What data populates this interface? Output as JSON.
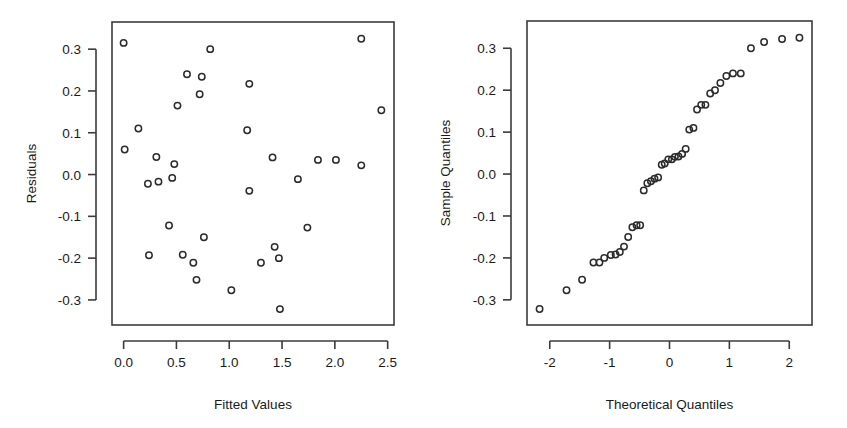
{
  "figure": {
    "background": "#ffffff",
    "point_color": "#2b2b2b",
    "axis_color": "#3b3b3b",
    "panel_count": 2
  },
  "chart_data": [
    {
      "type": "scatter",
      "id": "residuals-vs-fitted",
      "title": "",
      "xlabel": "Fitted Values",
      "ylabel": "Residuals",
      "xlim": [
        -0.11,
        2.56
      ],
      "ylim": [
        -0.36,
        0.365
      ],
      "xticks": [
        0.0,
        0.5,
        1.0,
        1.5,
        2.0,
        2.5
      ],
      "xticklabels": [
        "0.0",
        "0.5",
        "1.0",
        "1.5",
        "2.0",
        "2.5"
      ],
      "yticks": [
        0.3,
        0.2,
        0.1,
        0.0,
        -0.1,
        -0.2,
        -0.3
      ],
      "yticklabels": [
        "0.3",
        "0.2",
        "0.1",
        "0.0",
        "-0.1",
        "-0.2",
        "-0.3"
      ],
      "grid": false,
      "legend": false,
      "marker": "open-circle",
      "x": [
        0.0,
        0.01,
        0.14,
        0.23,
        0.24,
        0.31,
        0.33,
        0.43,
        0.46,
        0.48,
        0.51,
        0.56,
        0.6,
        0.66,
        0.69,
        0.72,
        0.74,
        0.76,
        0.82,
        1.02,
        1.17,
        1.19,
        1.19,
        1.3,
        1.41,
        1.43,
        1.47,
        1.48,
        1.65,
        1.74,
        1.84,
        2.01,
        2.25,
        2.25,
        2.44
      ],
      "y": [
        0.315,
        0.06,
        0.11,
        -0.022,
        -0.193,
        0.042,
        -0.017,
        -0.122,
        -0.008,
        0.025,
        0.165,
        -0.192,
        0.24,
        -0.211,
        -0.252,
        0.192,
        0.234,
        -0.15,
        0.3,
        -0.277,
        0.106,
        0.217,
        -0.039,
        -0.211,
        0.041,
        -0.173,
        -0.2,
        -0.322,
        -0.011,
        -0.127,
        0.035,
        0.035,
        0.022,
        0.325,
        0.154
      ]
    },
    {
      "type": "scatter",
      "id": "normal-qq",
      "title": "",
      "xlabel": "Theoretical Quantiles",
      "ylabel": "Sample Quantiles",
      "xlim": [
        -2.38,
        2.38
      ],
      "ylim": [
        -0.36,
        0.365
      ],
      "xticks": [
        -2,
        -1,
        0,
        1,
        2
      ],
      "xticklabels": [
        "-2",
        "-1",
        "0",
        "1",
        "2"
      ],
      "yticks": [
        0.3,
        0.2,
        0.1,
        0.0,
        -0.1,
        -0.2,
        -0.3
      ],
      "yticklabels": [
        "0.3",
        "0.2",
        "0.1",
        "0.0",
        "-0.1",
        "-0.2",
        "-0.3"
      ],
      "grid": false,
      "legend": false,
      "marker": "open-circle",
      "x": [
        -2.17,
        -1.72,
        -1.46,
        -1.27,
        -1.17,
        -1.09,
        -0.98,
        -0.9,
        -0.83,
        -0.76,
        -0.69,
        -0.62,
        -0.55,
        -0.49,
        -0.43,
        -0.37,
        -0.31,
        -0.25,
        -0.19,
        -0.13,
        -0.08,
        -0.02,
        0.04,
        0.09,
        0.15,
        0.21,
        0.27,
        0.33,
        0.4,
        0.46,
        0.53,
        0.6,
        0.68,
        0.76,
        0.85,
        0.95,
        1.06,
        1.19,
        1.36,
        1.58,
        1.88,
        2.17
      ],
      "y": [
        -0.322,
        -0.277,
        -0.252,
        -0.211,
        -0.211,
        -0.2,
        -0.193,
        -0.192,
        -0.186,
        -0.173,
        -0.15,
        -0.127,
        -0.122,
        -0.122,
        -0.039,
        -0.022,
        -0.017,
        -0.011,
        -0.008,
        0.022,
        0.025,
        0.035,
        0.035,
        0.041,
        0.042,
        0.048,
        0.06,
        0.106,
        0.11,
        0.154,
        0.165,
        0.165,
        0.192,
        0.2,
        0.217,
        0.234,
        0.24,
        0.24,
        0.3,
        0.315,
        0.322,
        0.325
      ]
    }
  ]
}
